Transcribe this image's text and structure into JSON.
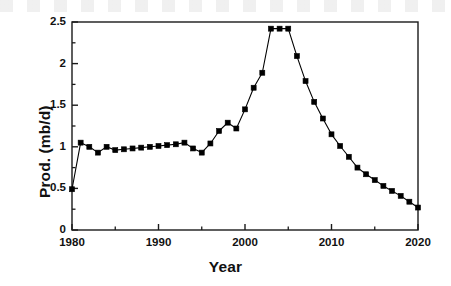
{
  "chart_data": {
    "type": "line",
    "title": "",
    "subtitle": "",
    "xlabel": "Year",
    "ylabel": "Prod. (mb/d)",
    "xlim": [
      1980,
      2020
    ],
    "ylim": [
      0,
      2.5
    ],
    "xticks": [
      1980,
      1990,
      2000,
      2010,
      2020
    ],
    "xtick_labels": [
      "1980",
      "1990",
      "2000",
      "2010",
      "2020"
    ],
    "xminor_ticks": [
      1985,
      1995,
      2005,
      2015
    ],
    "yticks": [
      0,
      0.5,
      1,
      1.5,
      2,
      2.5
    ],
    "ytick_labels": [
      "0",
      "0.5",
      "1",
      "1.5",
      "2",
      "2.5"
    ],
    "yminor_ticks": [
      0.25,
      0.75,
      1.25,
      1.75,
      2.25
    ],
    "grid": false,
    "legend": null,
    "marker": "filled-square",
    "marker_color": "#000000",
    "line_color": "#000000",
    "series": [
      {
        "name": "Production",
        "x": [
          1980,
          1981,
          1982,
          1983,
          1984,
          1985,
          1986,
          1987,
          1988,
          1989,
          1990,
          1991,
          1992,
          1993,
          1994,
          1995,
          1996,
          1997,
          1998,
          1999,
          2000,
          2001,
          2002,
          2003,
          2004,
          2005,
          2006,
          2007,
          2008,
          2009,
          2010,
          2011,
          2012,
          2013,
          2014,
          2015,
          2016,
          2017,
          2018,
          2019,
          2020
        ],
        "values": [
          0.49,
          1.05,
          1.0,
          0.93,
          1.0,
          0.96,
          0.97,
          0.98,
          0.99,
          1.0,
          1.01,
          1.02,
          1.03,
          1.05,
          0.98,
          0.93,
          1.04,
          1.19,
          1.29,
          1.22,
          1.45,
          1.71,
          1.89,
          2.42,
          2.42,
          2.42,
          2.09,
          1.79,
          1.54,
          1.34,
          1.15,
          1.01,
          0.88,
          0.75,
          0.67,
          0.6,
          0.53,
          0.47,
          0.41,
          0.34,
          0.27
        ]
      }
    ]
  },
  "axes": {
    "x_axis_label": "Year",
    "y_axis_label": "Prod. (mb/d)"
  }
}
